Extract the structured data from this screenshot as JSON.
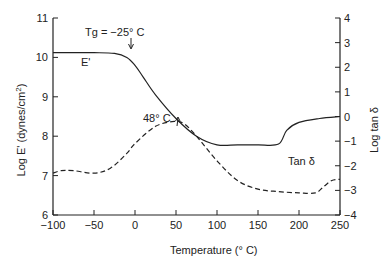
{
  "chart_data": {
    "type": "line",
    "title": "",
    "xlabel": "Temperature (° C)",
    "ylabel": "Log E' (dynes/cm²)",
    "y2label": "Log tan δ",
    "xlim": [
      -100,
      250
    ],
    "ylim": [
      6,
      11
    ],
    "y2lim": [
      -4,
      4
    ],
    "x_ticks": [
      "−100",
      "−50",
      "0",
      "50",
      "100",
      "150",
      "200",
      "250"
    ],
    "y_ticks": [
      "6",
      "7",
      "8",
      "9",
      "10",
      "11"
    ],
    "y2_ticks": [
      "−4",
      "−3",
      "−2",
      "−1",
      "0",
      "1",
      "2",
      "3",
      "4"
    ],
    "grid": false,
    "series": [
      {
        "name": "E'",
        "axis": "left",
        "style": "solid",
        "x": [
          -100,
          -50,
          -25,
          -10,
          0,
          10,
          25,
          50,
          75,
          100,
          125,
          150,
          175,
          185,
          200,
          225,
          250
        ],
        "values": [
          10.12,
          10.12,
          10.1,
          10.0,
          9.8,
          9.5,
          9.05,
          8.45,
          8.0,
          7.78,
          7.78,
          7.78,
          7.8,
          8.15,
          8.35,
          8.45,
          8.5
        ]
      },
      {
        "name": "Tan δ",
        "axis": "right",
        "style": "dashed",
        "x": [
          -100,
          -90,
          -75,
          -50,
          -30,
          -10,
          0,
          25,
          48,
          60,
          75,
          100,
          125,
          150,
          175,
          200,
          220,
          230,
          240,
          250
        ],
        "values": [
          -2.3,
          -2.2,
          -2.2,
          -2.3,
          -2.1,
          -1.5,
          -1.1,
          -0.4,
          -0.2,
          -0.3,
          -0.8,
          -1.8,
          -2.6,
          -2.95,
          -3.05,
          -3.1,
          -3.1,
          -2.85,
          -2.6,
          -2.55
        ]
      }
    ],
    "annotations": [
      {
        "text": "Tg = −25° C",
        "x": -25,
        "arrow": true
      },
      {
        "text": "E'",
        "x": -40,
        "y": 9.9
      },
      {
        "text": "48° C",
        "x": 48,
        "arrow": true
      },
      {
        "text": "Tan δ",
        "x": 190,
        "y": 7.3
      }
    ]
  },
  "labels": {
    "xlabel": "Temperature (° C)",
    "ylabel": "Log E' (dynes/cm",
    "ylabel_sup": "2",
    "ylabel_end": ")",
    "y2label": "Log tan δ",
    "tg": "Tg = −25° C",
    "e_prime": "E'",
    "peak": "48° C",
    "tan_delta": "Tan δ"
  }
}
